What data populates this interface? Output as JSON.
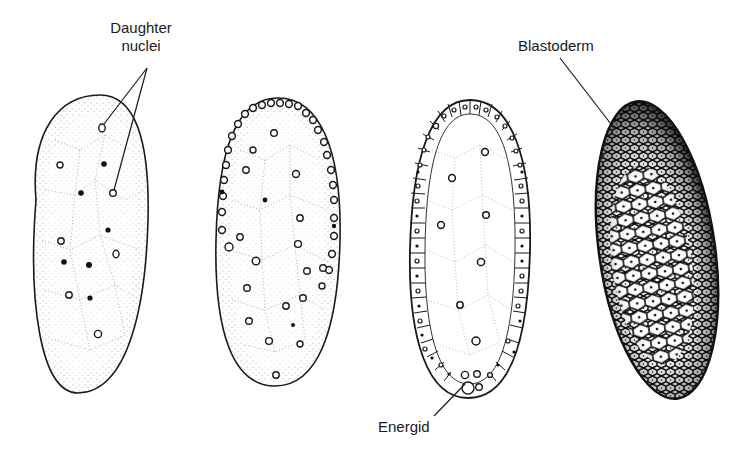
{
  "figure": {
    "labels": {
      "daughter_nuclei_line1": "Daughter",
      "daughter_nuclei_line2": "nuclei",
      "blastoderm": "Blastoderm",
      "energid": "Energid"
    },
    "stages": [
      {
        "id": "stage-1",
        "description": "Egg with scattered daughter nuclei in cytoplasm"
      },
      {
        "id": "stage-2",
        "description": "Nuclei migrating to the periphery"
      },
      {
        "id": "stage-3",
        "description": "Peripheral cells forming with energids at posterior pole"
      },
      {
        "id": "stage-4",
        "description": "Complete cellular blastoderm"
      }
    ],
    "colors": {
      "ink": "#1a1a1a",
      "background": "#ffffff"
    }
  }
}
